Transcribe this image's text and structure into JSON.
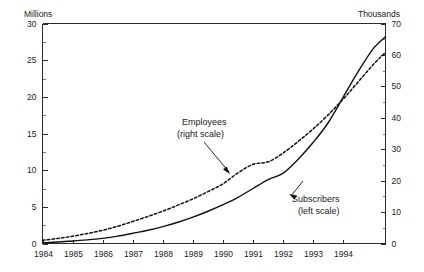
{
  "chart_data": {
    "type": "line",
    "title": "",
    "subtitle": "",
    "xlabel": "",
    "grid": false,
    "legend_position": "inline-annotations",
    "x_tick_labels": [
      "1984",
      "1985",
      "1986",
      "1987",
      "1988",
      "1989",
      "1990",
      "1991",
      "1992",
      "1993",
      "1994"
    ],
    "xlim": [
      1984,
      1995.4
    ],
    "axes": [
      {
        "id": "left",
        "unit_label": "Millions",
        "ylim": [
          0,
          30
        ],
        "tick_step": 5,
        "minor_tick_step": 2.5,
        "tick_labels": [
          "0",
          "5",
          "10",
          "15",
          "20",
          "25",
          "30"
        ],
        "tick_values": [
          0,
          5,
          10,
          15,
          20,
          25,
          30
        ]
      },
      {
        "id": "right",
        "unit_label": "Thousands",
        "ylim": [
          0,
          70
        ],
        "tick_step": 10,
        "minor_tick_step": 5,
        "tick_labels": [
          "0",
          "10",
          "20",
          "30",
          "40",
          "50",
          "60",
          "70"
        ],
        "tick_values": [
          0,
          10,
          20,
          30,
          40,
          50,
          60,
          70
        ]
      }
    ],
    "series": [
      {
        "name": "Subscribers",
        "scale": "left",
        "unit": "Millions",
        "style": "solid",
        "color": "#111111",
        "annotation": "Subscribers\n(left scale)",
        "x": [
          1984.0,
          1984.5,
          1985.0,
          1985.5,
          1986.0,
          1986.5,
          1987.0,
          1987.5,
          1988.0,
          1988.5,
          1989.0,
          1989.5,
          1990.0,
          1990.5,
          1991.0,
          1991.5,
          1992.0,
          1992.5,
          1993.0,
          1993.5,
          1994.0,
          1994.5,
          1995.0,
          1995.4
        ],
        "values": [
          0.1,
          0.2,
          0.35,
          0.5,
          0.7,
          1.0,
          1.4,
          1.8,
          2.3,
          2.9,
          3.6,
          4.4,
          5.3,
          6.3,
          7.5,
          8.7,
          9.6,
          11.5,
          13.8,
          16.5,
          20.0,
          23.5,
          26.6,
          28.2
        ]
      },
      {
        "name": "Employees",
        "scale": "right",
        "unit": "Thousands",
        "style": "dashed",
        "color": "#111111",
        "annotation": "Employees\n(right scale)",
        "x": [
          1984.0,
          1984.5,
          1985.0,
          1985.5,
          1986.0,
          1986.5,
          1987.0,
          1987.5,
          1988.0,
          1988.5,
          1989.0,
          1989.5,
          1990.0,
          1990.5,
          1991.0,
          1991.5,
          1992.0,
          1992.5,
          1993.0,
          1993.5,
          1994.0,
          1994.5,
          1995.0,
          1995.4
        ],
        "values": [
          1.0,
          1.6,
          2.3,
          3.2,
          4.2,
          5.5,
          7.0,
          8.6,
          10.3,
          12.2,
          14.2,
          16.5,
          19.0,
          22.5,
          25.2,
          26.0,
          28.8,
          32.5,
          36.5,
          41.0,
          46.0,
          51.5,
          57.0,
          60.8
        ]
      }
    ],
    "annotations": [
      {
        "id": "employees",
        "line1": "Employees",
        "line2": "(right scale)",
        "points_to": "dashed-series"
      },
      {
        "id": "subscribers",
        "line1": "Subscribers",
        "line2": "(left scale)",
        "points_to": "solid-series"
      }
    ]
  },
  "colors": {
    "background": "#ffffff",
    "ink": "#111111",
    "axis": "#2b2b2b"
  }
}
